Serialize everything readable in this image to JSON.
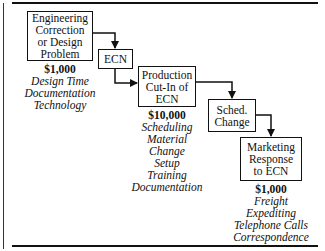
{
  "diagram": {
    "boxes": [
      {
        "id": "engineering",
        "lines": [
          "Engineering",
          "Correction",
          "or Design",
          "Problem"
        ]
      },
      {
        "id": "ecn",
        "lines": [
          "ECN"
        ]
      },
      {
        "id": "production",
        "lines": [
          "Production",
          "Cut-In of",
          "ECN"
        ]
      },
      {
        "id": "sched",
        "lines": [
          "Sched.",
          "Change"
        ]
      },
      {
        "id": "marketing",
        "lines": [
          "Marketing",
          "Response",
          "to ECN"
        ]
      }
    ],
    "costs": [
      {
        "for": "engineering",
        "amount": "$1,000",
        "items": [
          "Design Time",
          "Documentation",
          "Technology"
        ]
      },
      {
        "for": "production",
        "amount": "$10,000",
        "items": [
          "Scheduling",
          "Material",
          "Change",
          "Setup",
          "Training",
          "Documentation"
        ]
      },
      {
        "for": "marketing",
        "amount": "$1,000",
        "items": [
          "Freight",
          "Expediting",
          "Telephone Calls",
          "Correspondence"
        ]
      }
    ],
    "colors": {
      "line": "#111111",
      "background": "#ffffff"
    }
  }
}
